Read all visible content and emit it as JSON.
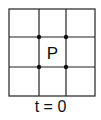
{
  "diagram": {
    "center_label": "P",
    "time_label": "t = 0",
    "grid": {
      "rows": 3,
      "cols": 3
    },
    "colors": {
      "line": "#222222",
      "dot": "#111111",
      "background": "#ffffff"
    }
  }
}
